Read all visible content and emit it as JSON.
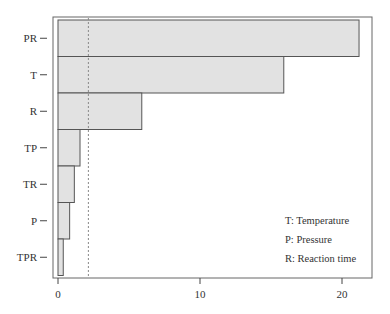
{
  "chart_data": {
    "type": "bar",
    "orientation": "horizontal",
    "title": "",
    "xlabel": "",
    "ylabel": "",
    "categories": [
      "PR",
      "T",
      "R",
      "TP",
      "TR",
      "P",
      "TPR"
    ],
    "values": [
      21.2,
      15.9,
      5.9,
      1.55,
      1.15,
      0.82,
      0.37
    ],
    "xlim": [
      -0.35,
      22.1
    ],
    "xticks": [
      0,
      10,
      20
    ],
    "xtick_labels": [
      "0",
      "10",
      "20"
    ],
    "reference_line": {
      "value": 2.14,
      "style": "dashed"
    },
    "grid": false,
    "legend": {
      "position": "lower right",
      "entries": [
        "T: Temperature",
        "P: Pressure",
        "R: Reaction time"
      ]
    },
    "colors": {
      "bar_fill": "#e2e2e2",
      "bar_stroke": "#555555",
      "axis": "#555555",
      "ref_line": "#777777"
    }
  }
}
